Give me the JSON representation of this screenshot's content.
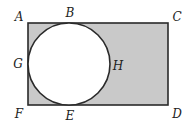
{
  "diagram": {
    "type": "geometry",
    "colors": {
      "stroke": "#2a2a2a",
      "shade": "#c9c9c9",
      "circle_fill": "#ffffff",
      "label": "#222222"
    },
    "rectangle": {
      "x": 28,
      "y": 23,
      "width": 140,
      "height": 82
    },
    "circle": {
      "cx": 69,
      "cy": 64,
      "r": 41
    },
    "points": {
      "A": {
        "label": "A",
        "x": 19,
        "y": 21
      },
      "B": {
        "label": "B",
        "x": 70,
        "y": 17
      },
      "C": {
        "label": "C",
        "x": 177,
        "y": 21
      },
      "G": {
        "label": "G",
        "x": 18,
        "y": 68
      },
      "H": {
        "label": "H",
        "x": 118,
        "y": 70
      },
      "F": {
        "label": "F",
        "x": 19,
        "y": 118
      },
      "E": {
        "label": "E",
        "x": 70,
        "y": 120
      },
      "D": {
        "label": "D",
        "x": 177,
        "y": 118
      }
    }
  }
}
